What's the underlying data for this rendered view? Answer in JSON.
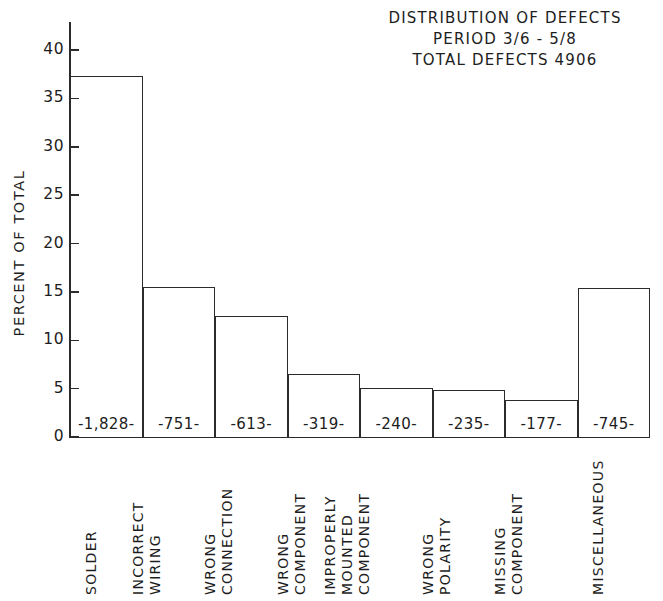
{
  "title": {
    "line1": "DISTRIBUTION OF DEFECTS",
    "line2": "PERIOD 3/6 - 5/8",
    "line3": "TOTAL DEFECTS 4906"
  },
  "axes": {
    "y_title": "PERCENT OF TOTAL",
    "y_ticks": [
      "0",
      "5",
      "10",
      "15",
      "20",
      "25",
      "30",
      "35",
      "40"
    ]
  },
  "bars": [
    {
      "value_label": "-1,828-",
      "category_lines": [
        "SOLDER"
      ]
    },
    {
      "value_label": "-751-",
      "category_lines": [
        "INCORRECT",
        "WIRING"
      ]
    },
    {
      "value_label": "-613-",
      "category_lines": [
        "WRONG",
        "CONNECTION"
      ]
    },
    {
      "value_label": "-319-",
      "category_lines": [
        "WRONG",
        "COMPONENT"
      ]
    },
    {
      "value_label": "-240-",
      "category_lines": [
        "IMPROPERLY",
        "MOUNTED",
        "COMPONENT"
      ]
    },
    {
      "value_label": "-235-",
      "category_lines": [
        "WRONG",
        "POLARITY"
      ]
    },
    {
      "value_label": "-177-",
      "category_lines": [
        "MISSING",
        "COMPONENT"
      ]
    },
    {
      "value_label": "-745-",
      "category_lines": [
        "MISCELLANEOUS"
      ]
    }
  ],
  "chart_data": {
    "type": "bar",
    "title": "DISTRIBUTION OF DEFECTS",
    "subtitle": "PERIOD 3/6 - 5/8 | TOTAL DEFECTS 4906",
    "xlabel": "",
    "ylabel": "PERCENT OF TOTAL",
    "ylim": [
      0,
      41
    ],
    "yticks": [
      0,
      5,
      10,
      15,
      20,
      25,
      30,
      35,
      40
    ],
    "grid": false,
    "legend": "none",
    "total_defects": 4906,
    "period": "3/6 - 5/8",
    "categories": [
      "SOLDER",
      "INCORRECT WIRING",
      "WRONG CONNECTION",
      "WRONG COMPONENT",
      "IMPROPERLY MOUNTED COMPONENT",
      "WRONG POLARITY",
      "MISSING COMPONENT",
      "MISCELLANEOUS"
    ],
    "counts": [
      1828,
      751,
      613,
      319,
      240,
      235,
      177,
      745
    ],
    "values": [
      37.3,
      15.5,
      12.5,
      6.5,
      5.1,
      4.9,
      3.8,
      15.4
    ],
    "value_unit": "percent"
  },
  "colors": {
    "ink": "#1d1d1d",
    "line": "#2b2b2b",
    "background": "#ffffff"
  }
}
